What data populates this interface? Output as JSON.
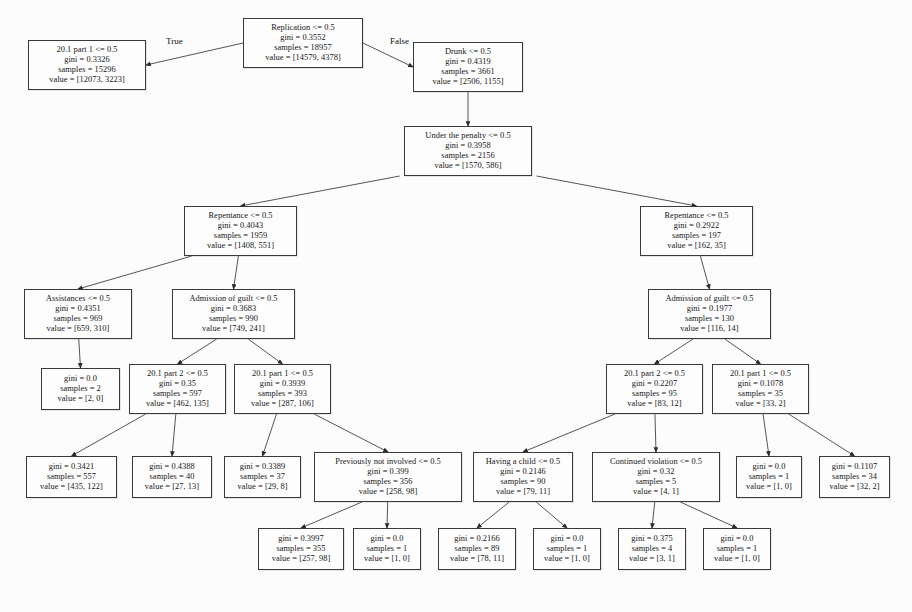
{
  "diagram": {
    "type": "decision-tree",
    "edge_labels": [
      {
        "text": "True",
        "x": 166,
        "y": 36
      },
      {
        "text": "False",
        "x": 390,
        "y": 36
      }
    ],
    "nodes": [
      {
        "id": "n0",
        "x": 243,
        "y": 18,
        "w": 120,
        "h": 50,
        "feature": "Replication <= 0.5",
        "gini": "gini = 0.3552",
        "samples": "samples = 18957",
        "value": "value = [14579, 4378]",
        "leaf": false
      },
      {
        "id": "n1",
        "x": 28,
        "y": 40,
        "w": 118,
        "h": 50,
        "feature": "20.1 part 1 <= 0.5",
        "gini": "gini = 0.3326",
        "samples": "samples = 15296",
        "value": "value = [12073, 3223]",
        "leaf": false
      },
      {
        "id": "n2",
        "x": 413,
        "y": 42,
        "w": 110,
        "h": 50,
        "feature": "Drunk <= 0.5",
        "gini": "gini = 0.4319",
        "samples": "samples = 3661",
        "value": "value = [2506, 1155]",
        "leaf": false
      },
      {
        "id": "n3",
        "x": 404,
        "y": 126,
        "w": 128,
        "h": 50,
        "feature": "Under the penalty <= 0.5",
        "gini": "gini = 0.3958",
        "samples": "samples = 2156",
        "value": "value = [1570, 586]",
        "leaf": false
      },
      {
        "id": "n4",
        "x": 184,
        "y": 206,
        "w": 113,
        "h": 50,
        "feature": "Repentance <= 0.5",
        "gini": "gini = 0.4043",
        "samples": "samples = 1959",
        "value": "value = [1408, 551]",
        "leaf": false
      },
      {
        "id": "n5",
        "x": 640,
        "y": 206,
        "w": 113,
        "h": 50,
        "feature": "Repentance <= 0.5",
        "gini": "gini = 0.2922",
        "samples": "samples = 197",
        "value": "value = [162, 35]",
        "leaf": false
      },
      {
        "id": "n6",
        "x": 24,
        "y": 289,
        "w": 108,
        "h": 50,
        "feature": "Assistances <= 0.5",
        "gini": "gini = 0.4351",
        "samples": "samples = 969",
        "value": "value = [659, 310]",
        "leaf": false
      },
      {
        "id": "n7",
        "x": 172,
        "y": 289,
        "w": 123,
        "h": 50,
        "feature": "Admission of guilt <= 0.5",
        "gini": "gini = 0.3683",
        "samples": "samples = 990",
        "value": "value = [749, 241]",
        "leaf": false
      },
      {
        "id": "n8",
        "x": 648,
        "y": 289,
        "w": 123,
        "h": 50,
        "feature": "Admission of guilt <= 0.5",
        "gini": "gini = 0.1977",
        "samples": "samples = 130",
        "value": "value = [116, 14]",
        "leaf": false
      },
      {
        "id": "n9",
        "x": 41,
        "y": 368,
        "w": 79,
        "h": 42,
        "feature": "",
        "gini": "gini = 0.0",
        "samples": "samples = 2",
        "value": "value = [2, 0]",
        "leaf": true
      },
      {
        "id": "n10",
        "x": 129,
        "y": 364,
        "w": 97,
        "h": 50,
        "feature": "20.1 part 2 <= 0.5",
        "gini": "gini = 0.35",
        "samples": "samples = 597",
        "value": "value = [462, 135]",
        "leaf": false
      },
      {
        "id": "n11",
        "x": 234,
        "y": 364,
        "w": 97,
        "h": 50,
        "feature": "20.1 part 1 <= 0.5",
        "gini": "gini = 0.3939",
        "samples": "samples = 393",
        "value": "value = [287, 106]",
        "leaf": false
      },
      {
        "id": "n12",
        "x": 606,
        "y": 364,
        "w": 97,
        "h": 50,
        "feature": "20.1 part 2 <= 0.5",
        "gini": "gini = 0.2207",
        "samples": "samples = 95",
        "value": "value = [83, 12]",
        "leaf": false
      },
      {
        "id": "n13",
        "x": 712,
        "y": 364,
        "w": 97,
        "h": 50,
        "feature": "20.1 part 1 <= 0.5",
        "gini": "gini = 0.1078",
        "samples": "samples = 35",
        "value": "value = [33, 2]",
        "leaf": false
      },
      {
        "id": "n14",
        "x": 26,
        "y": 456,
        "w": 91,
        "h": 42,
        "feature": "",
        "gini": "gini = 0.3421",
        "samples": "samples = 557",
        "value": "value = [435, 122]",
        "leaf": true
      },
      {
        "id": "n15",
        "x": 132,
        "y": 456,
        "w": 80,
        "h": 42,
        "feature": "",
        "gini": "gini = 0.4388",
        "samples": "samples = 40",
        "value": "value = [27, 13]",
        "leaf": true
      },
      {
        "id": "n16",
        "x": 224,
        "y": 456,
        "w": 77,
        "h": 42,
        "feature": "",
        "gini": "gini = 0.3389",
        "samples": "samples = 37",
        "value": "value = [29, 8]",
        "leaf": true
      },
      {
        "id": "n17",
        "x": 314,
        "y": 452,
        "w": 148,
        "h": 50,
        "feature": "Previously not involved <= 0.5",
        "gini": "gini = 0.399",
        "samples": "samples = 356",
        "value": "value = [258, 98]",
        "leaf": false
      },
      {
        "id": "n18",
        "x": 473,
        "y": 452,
        "w": 100,
        "h": 50,
        "feature": "Having a child <= 0.5",
        "gini": "gini = 0.2146",
        "samples": "samples = 90",
        "value": "value = [79, 11]",
        "leaf": false
      },
      {
        "id": "n19",
        "x": 592,
        "y": 452,
        "w": 128,
        "h": 50,
        "feature": "Continued violation <= 0.5",
        "gini": "gini = 0.32",
        "samples": "samples = 5",
        "value": "value = [4, 1]",
        "leaf": false
      },
      {
        "id": "n20",
        "x": 736,
        "y": 456,
        "w": 66,
        "h": 42,
        "feature": "",
        "gini": "gini = 0.0",
        "samples": "samples = 1",
        "value": "value = [1, 0]",
        "leaf": true
      },
      {
        "id": "n21",
        "x": 819,
        "y": 456,
        "w": 71,
        "h": 42,
        "feature": "",
        "gini": "gini = 0.1107",
        "samples": "samples = 34",
        "value": "value = [32, 2]",
        "leaf": true
      },
      {
        "id": "n22",
        "x": 258,
        "y": 528,
        "w": 86,
        "h": 42,
        "feature": "",
        "gini": "gini = 0.3997",
        "samples": "samples = 355",
        "value": "value = [257, 98]",
        "leaf": true
      },
      {
        "id": "n23",
        "x": 353,
        "y": 528,
        "w": 68,
        "h": 42,
        "feature": "",
        "gini": "gini = 0.0",
        "samples": "samples = 1",
        "value": "value = [1, 0]",
        "leaf": true
      },
      {
        "id": "n24",
        "x": 438,
        "y": 528,
        "w": 78,
        "h": 42,
        "feature": "",
        "gini": "gini = 0.2166",
        "samples": "samples = 89",
        "value": "value = [78, 11]",
        "leaf": true
      },
      {
        "id": "n25",
        "x": 533,
        "y": 528,
        "w": 68,
        "h": 42,
        "feature": "",
        "gini": "gini = 0.0",
        "samples": "samples = 1",
        "value": "value = [1, 0]",
        "leaf": true
      },
      {
        "id": "n26",
        "x": 618,
        "y": 528,
        "w": 68,
        "h": 42,
        "feature": "",
        "gini": "gini = 0.375",
        "samples": "samples = 4",
        "value": "value = [3, 1]",
        "leaf": true
      },
      {
        "id": "n27",
        "x": 703,
        "y": 528,
        "w": 68,
        "h": 42,
        "feature": "",
        "gini": "gini = 0.0",
        "samples": "samples = 1",
        "value": "value = [1, 0]",
        "leaf": true
      }
    ],
    "edges": [
      {
        "from": "n0",
        "to": "n1"
      },
      {
        "from": "n0",
        "to": "n2"
      },
      {
        "from": "n2",
        "to": "n3"
      },
      {
        "from": "n3",
        "to": "n4"
      },
      {
        "from": "n3",
        "to": "n5"
      },
      {
        "from": "n4",
        "to": "n6"
      },
      {
        "from": "n4",
        "to": "n7"
      },
      {
        "from": "n5",
        "to": "n8"
      },
      {
        "from": "n6",
        "to": "n9"
      },
      {
        "from": "n7",
        "to": "n10"
      },
      {
        "from": "n7",
        "to": "n11"
      },
      {
        "from": "n8",
        "to": "n12"
      },
      {
        "from": "n8",
        "to": "n13"
      },
      {
        "from": "n10",
        "to": "n14"
      },
      {
        "from": "n10",
        "to": "n15"
      },
      {
        "from": "n11",
        "to": "n16"
      },
      {
        "from": "n11",
        "to": "n17"
      },
      {
        "from": "n12",
        "to": "n18"
      },
      {
        "from": "n12",
        "to": "n19"
      },
      {
        "from": "n13",
        "to": "n20"
      },
      {
        "from": "n13",
        "to": "n21"
      },
      {
        "from": "n17",
        "to": "n22"
      },
      {
        "from": "n17",
        "to": "n23"
      },
      {
        "from": "n18",
        "to": "n24"
      },
      {
        "from": "n18",
        "to": "n25"
      },
      {
        "from": "n19",
        "to": "n26"
      },
      {
        "from": "n19",
        "to": "n27"
      }
    ]
  }
}
